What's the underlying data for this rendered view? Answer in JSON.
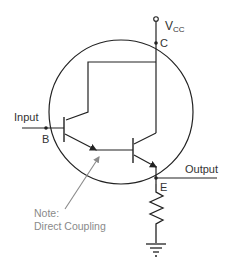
{
  "diagram": {
    "labels": {
      "vcc_main": "V",
      "vcc_sub": "CC",
      "collector": "C",
      "base": "B",
      "emitter": "E",
      "input": "Input",
      "output": "Output",
      "note_line1": "Note:",
      "note_line2": "Direct Coupling"
    },
    "components": [
      "Q1 NPN transistor",
      "Q2 NPN transistor",
      "emitter resistor",
      "ground",
      "Vcc terminal",
      "enclosing circle"
    ],
    "colors": {
      "wire": "#222222",
      "note": "#8a8a8a",
      "note_arrow": "#8a8a8a"
    }
  }
}
